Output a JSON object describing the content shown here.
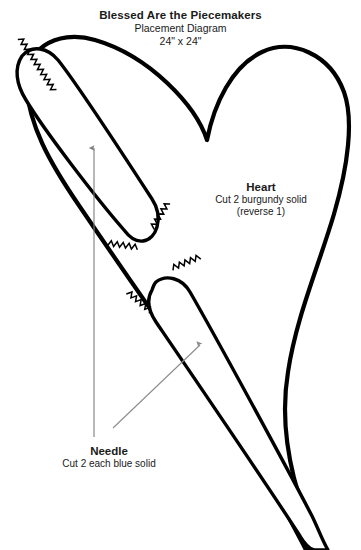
{
  "document": {
    "kind": "quilt-placement-diagram",
    "background_color": "#ffffff",
    "ink_color": "#000000",
    "hidden_line_color": "#9a9a9a",
    "leader_color": "#8c8c8c"
  },
  "title": {
    "main": "Blessed Are the Piecemakers",
    "subtitle": "Placement Diagram",
    "dimensions": "24\" x 24\""
  },
  "labels": {
    "heart": {
      "name": "Heart",
      "instruction": "Cut 2 burgundy solid",
      "note": "(reverse 1)"
    },
    "needle": {
      "name": "Needle",
      "instruction": "Cut 2 each blue solid"
    }
  },
  "shapes": {
    "heart": {
      "name": "heart",
      "outline_path": "M 95 40 C 55 28 22 52 26 86 C 30 126 48 160 78 204 C 120 266 200 380 252 452 C 262 468 272 486 282 504 C 292 524 300 538 306 550 L 318 550 C 310 528 300 500 294 478 C 286 446 282 408 288 372 C 296 318 318 268 334 214 C 348 166 354 120 344 92 C 330 54 292 38 262 52 C 232 66 214 104 207 140 C 196 106 150 56 95 40 Z",
      "stroke_width": 4.2
    },
    "needle_upper": {
      "name": "needle-upper-left",
      "outline_path": "M 22 56 C 14 68 16 84 26 100 C 44 130 96 198 124 230 C 130 238 136 242 143 241 C 150 240 155 234 157 227 C 160 216 158 208 152 199 C 128 162 74 80 58 60 C 48 48 32 44 22 56 Z",
      "stroke_width": 3.4,
      "eye_corner": [
        143,
        241
      ],
      "tip": [
        28,
        58
      ]
    },
    "needle_lower": {
      "name": "needle-lower-right",
      "outline_path": "M 152 290 C 146 300 148 310 156 322 C 186 366 268 486 300 536 C 306 546 310 549 314 550 L 328 550 C 322 540 318 528 312 516 C 284 462 212 330 190 292 C 182 278 166 274 156 282 C 154 284 153 287 152 290 Z",
      "stroke_width": 3.4,
      "eye_corner": [
        186,
        278
      ],
      "tip": [
        318,
        548
      ]
    }
  },
  "annotations": {
    "grain_arrow_vertical": {
      "name": "grain-line-arrow-upper-needle",
      "from": [
        94,
        437
      ],
      "to": [
        94,
        148
      ]
    },
    "leader_needle": {
      "name": "leader-line-needle-label",
      "from": [
        113,
        428
      ],
      "to": [
        200,
        345
      ]
    },
    "hidden_edge": {
      "name": "hidden-heart-edge",
      "path": "M 48 52 C 38 72 38 96 44 118 C 48 134 54 146 60 156"
    },
    "stitch_marks": [
      {
        "name": "stitch-upper-needle-tip",
        "x": 20,
        "y": 38,
        "angle": 57,
        "length": 62
      },
      {
        "name": "stitch-upper-needle-eye-left",
        "x": 108,
        "y": 243,
        "angle": 8,
        "length": 30
      },
      {
        "name": "stitch-upper-needle-eye-right",
        "x": 152,
        "y": 228,
        "angle": -58,
        "length": 30
      },
      {
        "name": "stitch-lower-needle-eye-left",
        "x": 128,
        "y": 292,
        "angle": 40,
        "length": 30
      },
      {
        "name": "stitch-lower-needle-eye-right",
        "x": 172,
        "y": 268,
        "angle": -22,
        "length": 30
      }
    ]
  }
}
